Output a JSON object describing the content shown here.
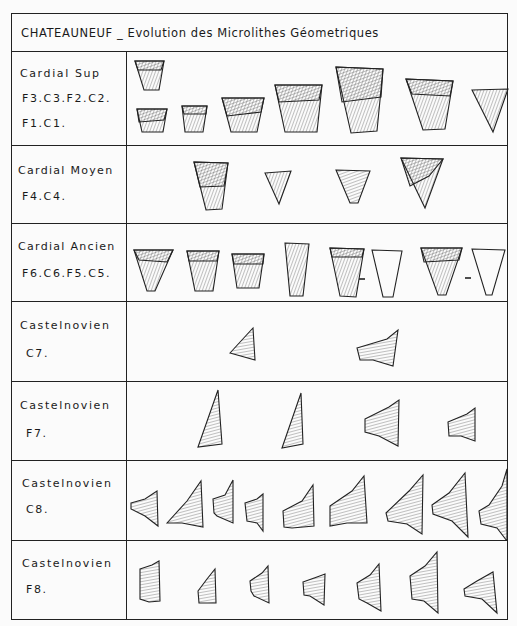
{
  "title": "CHATEAUNEUF _ Evolution des Microlithes Géometriques",
  "rows": [
    {
      "phase": "Cardial Sup",
      "layers": "F3.C3.F2.C2.",
      "layers2": "F1.C1.",
      "count": 8,
      "shape": "trapezes"
    },
    {
      "phase": "Cardial Moyen",
      "layers": "F4.C4.",
      "count": 4,
      "shape": "trapezes-triangles"
    },
    {
      "phase": "Cardial Ancien",
      "layers": "F6.C6.F5.C5.",
      "count": 8,
      "shape": "trapezes-with-profiles"
    },
    {
      "phase": "Castelnovien",
      "layers": "C7.",
      "count": 2,
      "shape": "asymmetric-trapezes"
    },
    {
      "phase": "Castelnovien",
      "layers": "F7.",
      "count": 4,
      "shape": "triangles-trapezes"
    },
    {
      "phase": "Castelnovien",
      "layers": "C8.",
      "count": 9,
      "shape": "asymmetric-trapezes"
    },
    {
      "phase": "Castelnovien",
      "layers": "F8.",
      "count": 7,
      "shape": "asymmetric-trapezes"
    }
  ],
  "separators": [
    "-",
    "-"
  ]
}
